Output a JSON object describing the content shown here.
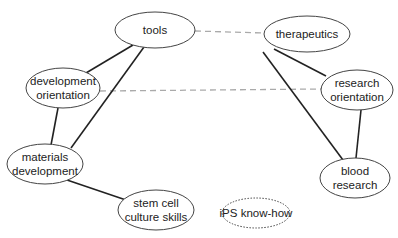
{
  "diagram": {
    "nodes": [
      {
        "id": "tools",
        "lines": [
          "tools"
        ],
        "cx": 155,
        "cy": 30,
        "rx": 40,
        "ry": 18,
        "style": "solid"
      },
      {
        "id": "therapeutics",
        "lines": [
          "therapeutics"
        ],
        "cx": 307,
        "cy": 34,
        "rx": 43,
        "ry": 18,
        "style": "solid"
      },
      {
        "id": "development-orientation",
        "lines": [
          "development",
          "orientation"
        ],
        "cx": 63,
        "cy": 88,
        "rx": 37,
        "ry": 20,
        "style": "solid"
      },
      {
        "id": "research-orientation",
        "lines": [
          "research",
          "orientation"
        ],
        "cx": 357,
        "cy": 90,
        "rx": 36,
        "ry": 20,
        "style": "solid"
      },
      {
        "id": "materials-development",
        "lines": [
          "materials",
          "development"
        ],
        "cx": 45,
        "cy": 164,
        "rx": 38,
        "ry": 20,
        "style": "solid"
      },
      {
        "id": "blood-research",
        "lines": [
          "blood",
          "research"
        ],
        "cx": 355,
        "cy": 178,
        "rx": 35,
        "ry": 20,
        "style": "solid"
      },
      {
        "id": "stem-cell-culture-skills",
        "lines": [
          "stem cell",
          "culture skills"
        ],
        "cx": 156,
        "cy": 210,
        "rx": 38,
        "ry": 20,
        "style": "solid"
      },
      {
        "id": "ips-know-how",
        "lines": [
          "iPS know-how"
        ],
        "cx": 256,
        "cy": 213,
        "rx": 34,
        "ry": 15,
        "style": "dotted"
      }
    ],
    "edges": [
      {
        "from": "tools",
        "to": "therapeutics",
        "style": "dashed",
        "x1": 195,
        "y1": 31,
        "x2": 264,
        "y2": 33
      },
      {
        "from": "development-orientation",
        "to": "research-orientation",
        "style": "dashed",
        "x1": 100,
        "y1": 91,
        "x2": 321,
        "y2": 89
      },
      {
        "from": "tools",
        "to": "development-orientation",
        "style": "solid",
        "x1": 133,
        "y1": 45,
        "x2": 86,
        "y2": 73
      },
      {
        "from": "tools",
        "to": "materials-development",
        "style": "solid",
        "x1": 144,
        "y1": 47,
        "x2": 71,
        "y2": 148
      },
      {
        "from": "development-orientation",
        "to": "materials-development",
        "style": "solid",
        "x1": 58,
        "y1": 108,
        "x2": 51,
        "y2": 145
      },
      {
        "from": "materials-development",
        "to": "stem-cell-culture-skills",
        "style": "solid",
        "x1": 67,
        "y1": 180,
        "x2": 126,
        "y2": 200
      },
      {
        "from": "therapeutics",
        "to": "research-orientation",
        "style": "solid",
        "x1": 274,
        "y1": 49,
        "x2": 326,
        "y2": 76
      },
      {
        "from": "therapeutics",
        "to": "blood-research",
        "style": "solid",
        "x1": 263,
        "y1": 52,
        "x2": 343,
        "y2": 160
      },
      {
        "from": "research-orientation",
        "to": "blood-research",
        "style": "solid",
        "x1": 361,
        "y1": 110,
        "x2": 356,
        "y2": 158
      }
    ],
    "colors": {
      "node_stroke": "#444444",
      "solid_edge": "#222222",
      "dashed_edge": "#aaaaaa",
      "text": "#222222"
    }
  }
}
